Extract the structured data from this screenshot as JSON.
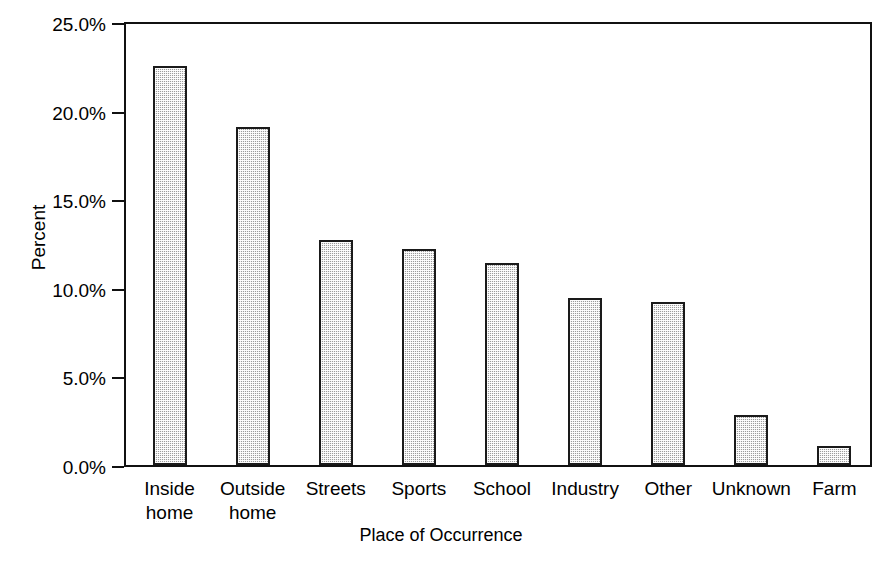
{
  "chart_data": {
    "type": "bar",
    "title": "",
    "xlabel": "Place of Occurrence",
    "ylabel": "Percent",
    "categories": [
      "Inside\nhome",
      "Outside\nhome",
      "Streets",
      "Sports",
      "School",
      "Industry",
      "Other",
      "Unknown",
      "Farm"
    ],
    "values": [
      22.5,
      19.1,
      12.7,
      12.2,
      11.4,
      9.4,
      9.2,
      2.8,
      1.1
    ],
    "value_labels": [
      "22.5%",
      "19.1%",
      "12.7%",
      "12.2%",
      "11.4%",
      "9.4%",
      "9.2%",
      "2.8%",
      "1.1%"
    ],
    "ylim": [
      0,
      25
    ],
    "ytick_values": [
      0,
      5,
      10,
      15,
      20,
      25
    ],
    "ytick_labels": [
      "0.0%",
      "5.0%",
      "10.0%",
      "15.0%",
      "20.0%",
      "25.0%"
    ],
    "grid": false,
    "legend": false,
    "legend_position": "none",
    "bar_fill_color": "#c8c8c8",
    "bar_border_color": "#1a1a1a",
    "background_color": "#ffffff",
    "axis_color": "#111111"
  },
  "axis": {
    "y_title": "Percent",
    "x_title": "Place of Occurrence"
  },
  "ticks": {
    "y": [
      {
        "label": "25.0%",
        "value": 25
      },
      {
        "label": "20.0%",
        "value": 20
      },
      {
        "label": "15.0%",
        "value": 15
      },
      {
        "label": "10.0%",
        "value": 10
      },
      {
        "label": "5.0%",
        "value": 5
      },
      {
        "label": "0.0%",
        "value": 0
      }
    ],
    "x": [
      {
        "label": "Inside\nhome"
      },
      {
        "label": "Outside\nhome"
      },
      {
        "label": "Streets"
      },
      {
        "label": "Sports"
      },
      {
        "label": "School"
      },
      {
        "label": "Industry"
      },
      {
        "label": "Other"
      },
      {
        "label": "Unknown"
      },
      {
        "label": "Farm"
      }
    ]
  }
}
